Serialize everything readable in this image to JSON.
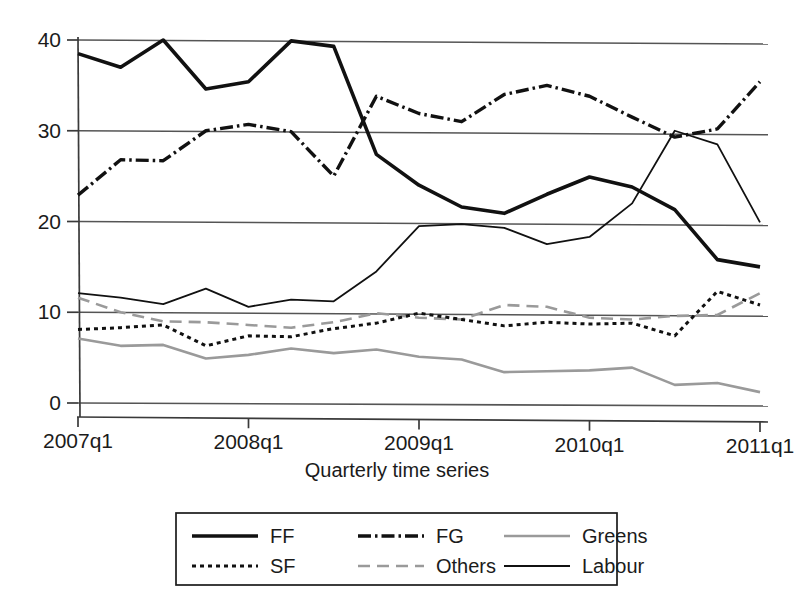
{
  "chart_data": {
    "type": "line",
    "title": "",
    "subtitle": "",
    "xlabel": "Quarterly time series",
    "ylabel": "",
    "xlim": [
      0,
      16
    ],
    "ylim": [
      0,
      40
    ],
    "grid": true,
    "grid_axis": "y",
    "legend_position": "bottom",
    "x": [
      "2007q1",
      "2007q2",
      "2007q3",
      "2007q4",
      "2008q1",
      "2008q2",
      "2008q3",
      "2008q4",
      "2009q1",
      "2009q2",
      "2009q3",
      "2009q4",
      "2010q1",
      "2010q2",
      "2010q3",
      "2010q4",
      "2011q1"
    ],
    "xtick_labels": [
      "2007q1",
      "2008q1",
      "2009q1",
      "2010q1",
      "2011q1"
    ],
    "xtick_positions": [
      0,
      4,
      8,
      12,
      16
    ],
    "ytick_labels": [
      "0",
      "10",
      "20",
      "30",
      "40"
    ],
    "ytick_values": [
      0,
      10,
      20,
      30,
      40
    ],
    "series": [
      {
        "name": "FF",
        "style": "solid-thick",
        "color": "#111111",
        "values": [
          38.5,
          37.0,
          40.0,
          34.6,
          35.4,
          39.9,
          39.3,
          27.4,
          24.0,
          21.6,
          20.9,
          23.0,
          24.9,
          23.8,
          21.3,
          15.8,
          15.0
        ]
      },
      {
        "name": "FG",
        "style": "dash-dot",
        "color": "#111111",
        "values": [
          22.9,
          26.8,
          26.7,
          30.0,
          30.7,
          29.9,
          25.0,
          33.8,
          31.9,
          31.0,
          34.0,
          35.0,
          33.8,
          31.5,
          29.3,
          30.2,
          35.4
        ]
      },
      {
        "name": "Greens",
        "style": "solid-grey",
        "color": "#9a9a9a",
        "values": [
          7.1,
          6.3,
          6.4,
          4.9,
          5.3,
          6.0,
          5.5,
          5.9,
          5.1,
          4.8,
          3.4,
          3.5,
          3.6,
          3.9,
          2.0,
          2.2,
          1.2
        ]
      },
      {
        "name": "SF",
        "style": "dotted",
        "color": "#111111",
        "values": [
          8.1,
          8.3,
          8.6,
          6.3,
          7.4,
          7.3,
          8.2,
          8.8,
          9.9,
          9.2,
          8.5,
          8.9,
          8.7,
          8.8,
          7.4,
          12.3,
          10.8
        ]
      },
      {
        "name": "Others",
        "style": "dashed-grey",
        "color": "#9a9a9a",
        "values": [
          11.6,
          10.0,
          9.0,
          8.9,
          8.6,
          8.3,
          8.9,
          9.9,
          9.4,
          9.2,
          10.8,
          10.6,
          9.4,
          9.2,
          9.6,
          9.7,
          12.1
        ]
      },
      {
        "name": "Labour",
        "style": "solid-thin",
        "color": "#111111",
        "values": [
          12.1,
          11.6,
          10.9,
          12.6,
          10.6,
          11.4,
          11.2,
          14.5,
          19.5,
          19.7,
          19.3,
          17.5,
          18.3,
          22.0,
          30.0,
          28.5,
          19.9
        ]
      }
    ]
  },
  "axis": {
    "xlabel": "Quarterly time series"
  },
  "legend": {
    "entries": [
      {
        "label": "FF",
        "style": "solid-thick"
      },
      {
        "label": "FG",
        "style": "dash-dot"
      },
      {
        "label": "Greens",
        "style": "solid-grey"
      },
      {
        "label": "SF",
        "style": "dotted"
      },
      {
        "label": "Others",
        "style": "dashed-grey"
      },
      {
        "label": "Labour",
        "style": "solid-thin"
      }
    ]
  },
  "colors": {
    "ink": "#111111",
    "grey": "#9a9a9a",
    "grid": "#555555",
    "background": "#ffffff"
  }
}
